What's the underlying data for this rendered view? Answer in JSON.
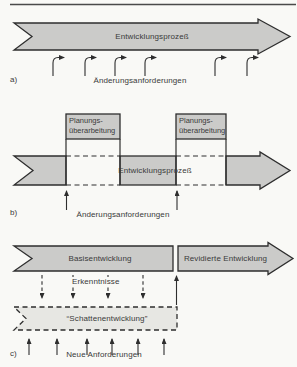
{
  "colors": {
    "band_fill": "#cbcbc9",
    "shadow_fill": "#e7e7e3",
    "line": "#2e2e2e"
  },
  "section_a": {
    "marker": "a)",
    "band_label": "Entwicklungsprozeß",
    "arrows_label": "Änderungsanforderungen"
  },
  "section_b": {
    "marker": "b)",
    "box1": {
      "line1": "Planungs-",
      "line2": "überarbeitung"
    },
    "box2": {
      "line1": "Planungs-",
      "line2": "überarbeitung"
    },
    "band_label": "Entwicklungsprozeß",
    "arrows_label": "Änderungsanforderungen"
  },
  "section_c": {
    "marker": "c)",
    "base_band_label": "Basisentwicklung",
    "revised_band_label": "Revidierte Entwicklung",
    "insights_label": "Erkenntnisse",
    "shadow_band_label": "“Schattenentwicklung”",
    "new_requirements_label": "Neue Anforderungen"
  }
}
